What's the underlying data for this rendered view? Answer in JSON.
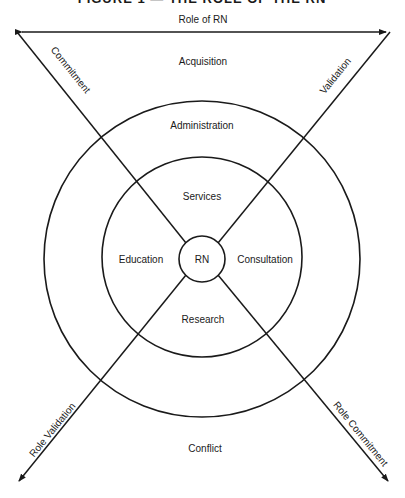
{
  "title": "FIGURE 1 — THE ROLE OF THE RN",
  "top_axis": {
    "label": "Role of RN"
  },
  "regions": {
    "outer_top": "Acquisition",
    "outer_bottom": "Conflict",
    "middle_ring": "Administration",
    "inner_top": "Services",
    "inner_left": "Education",
    "inner_right": "Consultation",
    "inner_bottom": "Research",
    "center": "RN"
  },
  "diagonals": {
    "upper_left": "Commitment",
    "upper_right": "Validation",
    "lower_left": "Role Validation",
    "lower_right": "Role Commitment"
  },
  "colors": {
    "ink": "#1a1a1a",
    "background": "#ffffff"
  }
}
